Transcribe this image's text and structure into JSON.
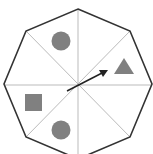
{
  "diagram": {
    "type": "octagon-spinner",
    "sections": 8,
    "colors": {
      "outline": "#333333",
      "divider": "#bbbbbb",
      "shape_fill": "#808080",
      "arrow": "#222222",
      "background": "#ffffff"
    },
    "shapes": [
      {
        "kind": "circle",
        "position": "top"
      },
      {
        "kind": "triangle",
        "position": "right-upper"
      },
      {
        "kind": "square",
        "position": "left-lower"
      },
      {
        "kind": "circle",
        "position": "bottom"
      }
    ],
    "arrow": {
      "points_to": "right-upper",
      "label": "spinner-arrow"
    }
  }
}
